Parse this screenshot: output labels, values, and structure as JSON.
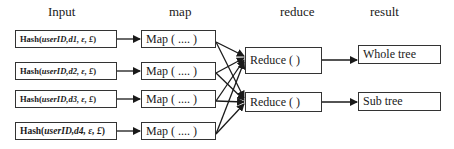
{
  "headers": {
    "input": "Input",
    "map": "map",
    "reduce": "reduce",
    "result": "result"
  },
  "inputs": [
    {
      "prefix": "Hash(",
      "args": "userID,d1, ε, £",
      "suffix": ")"
    },
    {
      "prefix": "Hash(",
      "args": "userID,d2, ε, £",
      "suffix": ")"
    },
    {
      "prefix": "Hash(",
      "args": "userID,d3, ε, £",
      "suffix": ")"
    },
    {
      "prefix": "Hash(",
      "args": "userID,d4, ε, £",
      "suffix": ")"
    }
  ],
  "maps": [
    {
      "label": "Map ( .... )"
    },
    {
      "label": "Map ( .... )"
    },
    {
      "label": "Map ( .... )"
    },
    {
      "label": "Map ( .... )"
    }
  ],
  "reducers": [
    {
      "label": "Reduce ( )"
    },
    {
      "label": "Reduce ( )"
    }
  ],
  "results": [
    {
      "label": "Whole tree"
    },
    {
      "label": "Sub tree"
    }
  ],
  "colors": {
    "line": "#1a1a1a",
    "border": "#333333"
  }
}
